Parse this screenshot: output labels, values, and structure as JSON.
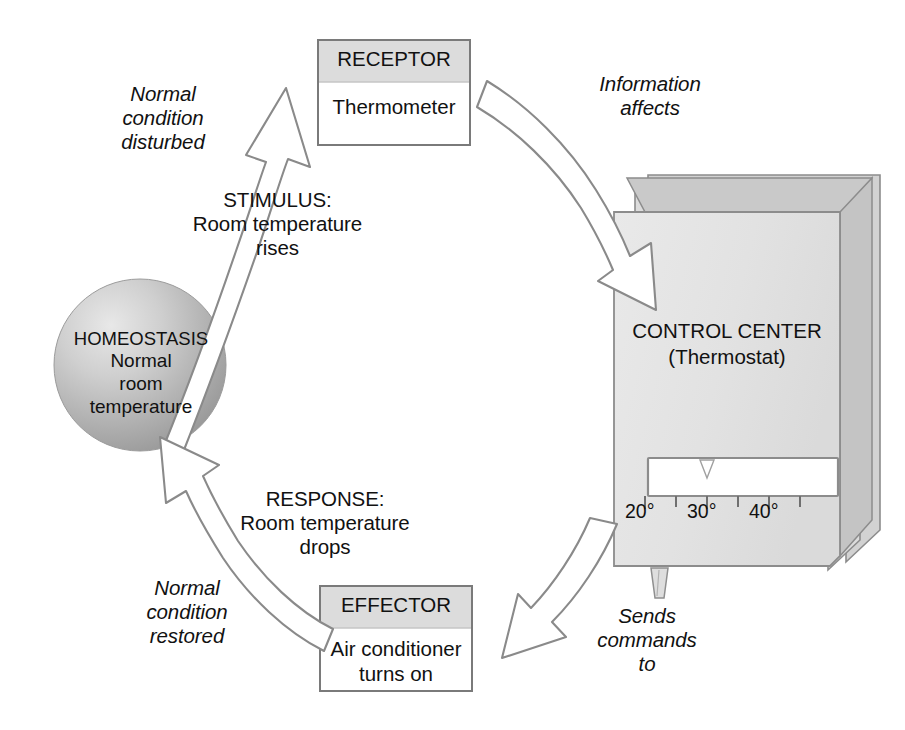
{
  "diagram": {
    "type": "cycle-flowchart"
  },
  "nodes": {
    "homeostasis": {
      "label_caps": "HOMEOSTASIS",
      "label_lines": "Normal\nroom\ntemperature",
      "shape": "circle",
      "fill": "#b0b0b0"
    },
    "receptor": {
      "header": "RECEPTOR",
      "body": "Thermometer",
      "header_fill": "#dcdcdc",
      "body_fill": "#ffffff",
      "border": "#7a7a7a"
    },
    "control_center": {
      "title": "CONTROL CENTER\n(Thermostat)",
      "fill": "#e4e4e4",
      "border": "#8c8c8c"
    },
    "effector": {
      "header": "EFFECTOR",
      "body": "Air conditioner\nturns on",
      "header_fill": "#dcdcdc",
      "body_fill": "#ffffff",
      "border": "#7a7a7a"
    }
  },
  "thermostat_scale": {
    "ticks": [
      "20°",
      "30°",
      "40°"
    ],
    "tick_count": 6,
    "display_fill": "#ffffff",
    "pointer": "down-triangle"
  },
  "arrows": [
    {
      "id": "stimulus",
      "from": "homeostasis",
      "to": "receptor",
      "italic_label": "Normal\ncondition\ndisturbed",
      "plain_label": "STIMULUS:\nRoom temperature\nrises"
    },
    {
      "id": "information",
      "from": "receptor",
      "to": "control_center",
      "italic_label": "Information\naffects",
      "plain_label": ""
    },
    {
      "id": "commands",
      "from": "control_center",
      "to": "effector",
      "italic_label": "Sends\ncommands\nto",
      "plain_label": ""
    },
    {
      "id": "response",
      "from": "effector",
      "to": "homeostasis",
      "italic_label": "Normal\ncondition\nrestored",
      "plain_label": "RESPONSE:\nRoom temperature\ndrops"
    }
  ],
  "colors": {
    "background": "#ffffff",
    "text": "#111111",
    "arrow_fill": "#ffffff",
    "arrow_stroke": "#8a8a8a",
    "box_header": "#dcdcdc",
    "thermostat_body": "#e4e4e4",
    "thermostat_shade": "#c9c9c9"
  }
}
